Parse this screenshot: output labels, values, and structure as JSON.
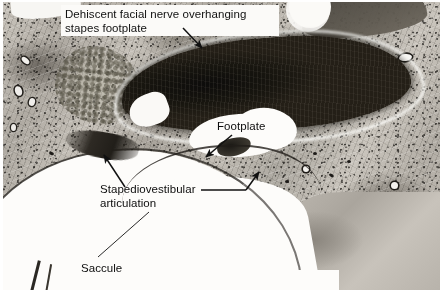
{
  "figure": {
    "type": "histology-micrograph",
    "width": 443,
    "height": 295,
    "border_color": "#ffffff",
    "tissue_tone": "grayscale"
  },
  "annotations": [
    {
      "id": "facial-nerve",
      "label": "Dehiscent facial nerve overhanging\nstapes footplate",
      "leader": "arrow-down-right",
      "points_to": "dark elongated nerve mass, upper center"
    },
    {
      "id": "footplate",
      "label": "Footplate",
      "leader": "arrow-down-left",
      "points_to": "white oval lumen at center"
    },
    {
      "id": "stapediovestibular-articulation",
      "label": "Stapediovestibular\narticulation",
      "leader": "arrow-up-left-and-right",
      "points_to": "dark junction band left of center and membrane to the right"
    },
    {
      "id": "saccule",
      "label": "Saccule",
      "leader": "thin-line-up-right",
      "points_to": "large white region lower left"
    }
  ],
  "structures": [
    {
      "name": "dehiscent facial nerve",
      "appearance": "dark elongated mass"
    },
    {
      "name": "stapes footplate",
      "appearance": "white oval lumen"
    },
    {
      "name": "stapediovestibular articulation",
      "appearance": "dark junction band"
    },
    {
      "name": "saccule",
      "appearance": "large white vestibular space"
    },
    {
      "name": "otic capsule bone",
      "appearance": "mottled gray matrix with lacunae"
    }
  ]
}
